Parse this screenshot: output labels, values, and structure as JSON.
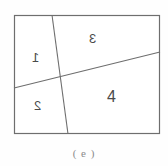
{
  "figure": {
    "caption": "( e )",
    "background_color": "#fefefe",
    "line_color": "#6e6e6e",
    "label_color": "#4a4a4a",
    "frame": {
      "name": "outer-rectangle",
      "x": 14,
      "y": 15,
      "width": 146,
      "height": 119
    },
    "dividing_lines": [
      {
        "name": "near-vertical-divider",
        "x1": 52,
        "y1": 15,
        "x2": 68,
        "y2": 134
      },
      {
        "name": "diagonal-divider",
        "x1": 14,
        "y1": 88,
        "x2": 160,
        "y2": 52
      }
    ],
    "intersection": {
      "x": 60,
      "y": 76
    },
    "regions": [
      {
        "id": "region-1",
        "label": "1",
        "mirrored": true,
        "position": "upper-left"
      },
      {
        "id": "region-2",
        "label": "2",
        "mirrored": true,
        "position": "lower-left"
      },
      {
        "id": "region-3",
        "label": "3",
        "mirrored": true,
        "position": "upper-right"
      },
      {
        "id": "region-4",
        "label": "4",
        "mirrored": false,
        "position": "lower-right"
      }
    ]
  }
}
